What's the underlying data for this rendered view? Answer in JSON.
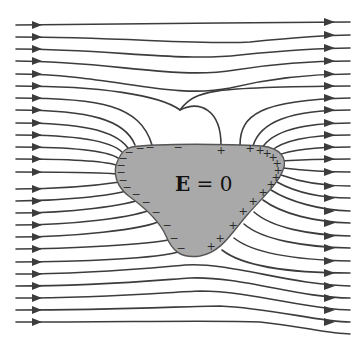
{
  "figure": {
    "label": {
      "symbol": "E",
      "relation": " = 0"
    },
    "colors": {
      "field_line": "#3c3c3c",
      "conductor_fill": "#a9a9a9",
      "conductor_edge": "#555555",
      "background": "#ffffff"
    },
    "field_lines": {
      "count": 25,
      "direction": "left-to-right",
      "left_start_x": 16,
      "left_arrow_x": 38,
      "right_arrow_x": 330,
      "right_end_x": 350,
      "y_positions": [
        25,
        37,
        49,
        61,
        74,
        86,
        98,
        110,
        123,
        135,
        147,
        159,
        172,
        189,
        201,
        213,
        225,
        237,
        249,
        262,
        274,
        286,
        298,
        310,
        322
      ]
    },
    "charges": {
      "negative_side": "left",
      "positive_side": "right",
      "negative_symbol": "−",
      "positive_symbol": "+"
    }
  }
}
